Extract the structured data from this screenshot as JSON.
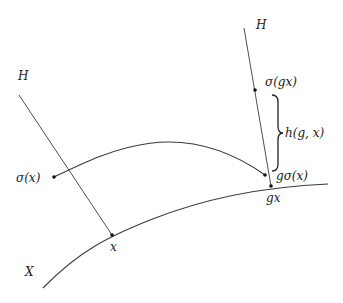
{
  "diagram": {
    "labels": {
      "H_left": "H",
      "H_right": "H",
      "sigma_x": "σ(x)",
      "sigma_gx": "σ(gx)",
      "h_gx": "h(g, x)",
      "g_sigma_x": "gσ(x)",
      "x": "x",
      "gx": "gx",
      "X": "X"
    },
    "points": {
      "sigma_x": [
        54,
        177
      ],
      "x": [
        112,
        235
      ],
      "sigma_gx": [
        255,
        90
      ],
      "g_sigma_x": [
        265,
        175
      ],
      "gx": [
        271,
        186
      ]
    },
    "colors": {
      "stroke": "#3a3a3a",
      "point": "#111111",
      "text": "#222222"
    }
  }
}
